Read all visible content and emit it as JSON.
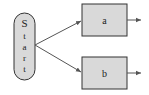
{
  "diagram": {
    "type": "flowchart",
    "colors": {
      "background": "#ffffff",
      "node_fill": "#d9d9d9",
      "node_stroke": "#333333",
      "edge": "#555555",
      "text": "#222222"
    },
    "nodes": [
      {
        "id": "start",
        "label": "Start",
        "letters": [
          "S",
          "t",
          "a",
          "r",
          "t"
        ],
        "shape": "capsule-vertical"
      },
      {
        "id": "a",
        "label": "a",
        "shape": "rectangle"
      },
      {
        "id": "b",
        "label": "b",
        "shape": "rectangle"
      }
    ],
    "edges": [
      {
        "from": "start",
        "to": "a"
      },
      {
        "from": "start",
        "to": "b"
      },
      {
        "from": "a",
        "to": "out"
      },
      {
        "from": "b",
        "to": "out"
      }
    ]
  }
}
